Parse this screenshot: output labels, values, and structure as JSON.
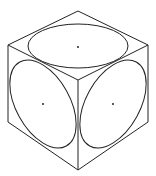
{
  "diagram": {
    "stroke_color": "#222222",
    "background": "#ffffff",
    "cube": {
      "vertices": {
        "top": [
          78,
          11
        ],
        "upper_left": [
          8,
          45
        ],
        "upper_right": [
          148,
          45
        ],
        "center": [
          78,
          80
        ],
        "lower_left": [
          8,
          122
        ],
        "lower_right": [
          148,
          122
        ],
        "bottom": [
          78,
          170
        ]
      }
    },
    "ellipses": [
      {
        "face": "top",
        "cx": 78,
        "cy": 46,
        "rx": 50,
        "ry": 22,
        "rotate": 0
      },
      {
        "face": "left",
        "cx": 43,
        "cy": 104,
        "rx": 48,
        "ry": 27,
        "rotate": 61
      },
      {
        "face": "right",
        "cx": 113,
        "cy": 104,
        "rx": 48,
        "ry": 27,
        "rotate": -61
      }
    ],
    "center_dots": [
      {
        "face": "top",
        "x": 78,
        "y": 47
      },
      {
        "face": "left",
        "x": 43,
        "y": 104
      },
      {
        "face": "right",
        "x": 113,
        "y": 104
      }
    ]
  }
}
